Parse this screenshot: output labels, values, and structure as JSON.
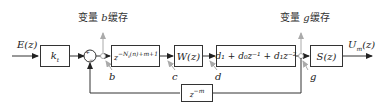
{
  "diagram": {
    "input_label": "E(z)",
    "output_label": "U",
    "output_sub": "m",
    "output_suffix": "(z)",
    "blocks": {
      "gain": {
        "main": "k",
        "sub": "t"
      },
      "delay_var": {
        "main": "z",
        "sup": "−N",
        "sup_sub": "t",
        "sup_rest": "(n)+m+1"
      },
      "w": {
        "label": "W(z)"
      },
      "poly": {
        "label": "d₁ + d₀z⁻¹ + d₁z⁻²"
      },
      "s": {
        "label": "S(z)"
      },
      "feedback": {
        "main": "z",
        "sup": "−m"
      }
    },
    "nodes": {
      "b": "b",
      "c": "c",
      "d": "d",
      "g": "g"
    },
    "annotations": {
      "cache_b": {
        "pre": "变量 ",
        "var": "b",
        "post": "缓存"
      },
      "cache_g": {
        "pre": "变量 ",
        "var": "g",
        "post": "缓存"
      }
    },
    "summer_signs": {
      "top": "+",
      "bottom": "−"
    },
    "colors": {
      "line": "#333333",
      "annotation_arrow": "#aaaaaa"
    }
  }
}
